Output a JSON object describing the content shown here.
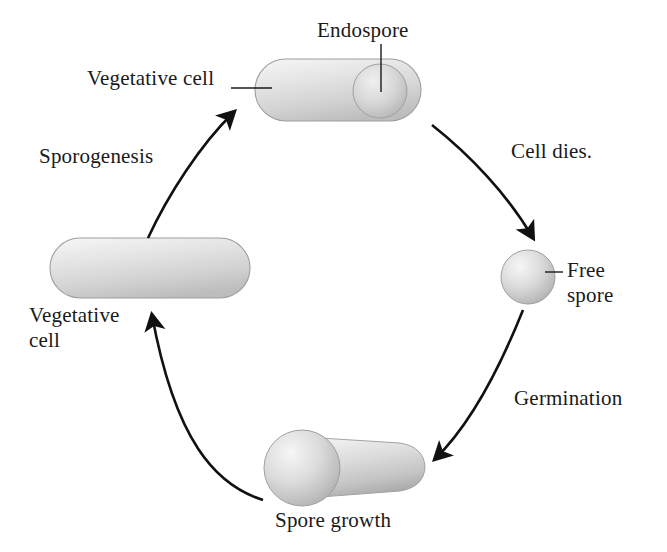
{
  "diagram": {
    "labels": {
      "endospore": "Endospore",
      "vegetative_cell_top": "Vegetative cell",
      "sporogenesis": "Sporogenesis",
      "cell_dies": "Cell dies.",
      "free_spore_line1": "Free",
      "free_spore_line2": "spore",
      "vegetative_cell_left_line1": "Vegetative",
      "vegetative_cell_left_line2": "cell",
      "germination": "Germination",
      "spore_growth": "Spore growth"
    },
    "colors": {
      "background": "#ffffff",
      "text": "#1a1a1a",
      "stroke": "#111111",
      "cell_fill_light": "#f2f2f2",
      "cell_fill_mid": "#d8d8d8",
      "cell_fill_dark": "#b4b4b4",
      "spore_fill_light": "#efefef",
      "spore_fill_dark": "#a9a9a9",
      "outline": "#9a9a9a"
    },
    "stages": [
      {
        "id": "vegetative-cell-with-endospore",
        "name": "Vegetative cell containing endospore",
        "shape": "capsule-with-sphere",
        "position": "top"
      },
      {
        "id": "free-spore",
        "name": "Free spore",
        "shape": "sphere",
        "position": "right"
      },
      {
        "id": "spore-growth",
        "name": "Spore growth",
        "shape": "sphere-with-tube",
        "position": "bottom"
      },
      {
        "id": "vegetative-cell",
        "name": "Vegetative cell",
        "shape": "capsule",
        "position": "left"
      }
    ],
    "transitions": [
      {
        "id": "cell-dies",
        "from": "vegetative-cell-with-endospore",
        "to": "free-spore",
        "label": "Cell dies."
      },
      {
        "id": "germination",
        "from": "free-spore",
        "to": "spore-growth",
        "label": "Germination"
      },
      {
        "id": "spore-to-vegetative",
        "from": "spore-growth",
        "to": "vegetative-cell",
        "label": ""
      },
      {
        "id": "sporogenesis",
        "from": "vegetative-cell",
        "to": "vegetative-cell-with-endospore",
        "label": "Sporogenesis"
      }
    ]
  }
}
